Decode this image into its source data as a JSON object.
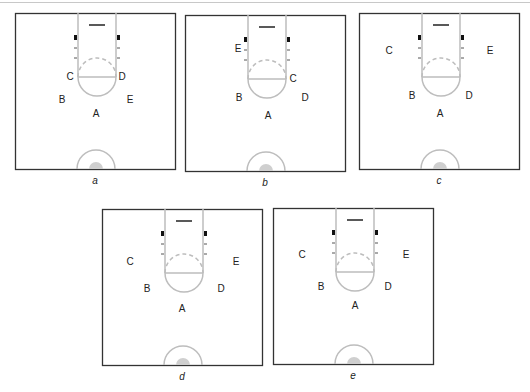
{
  "figure": {
    "colors": {
      "border": "#333333",
      "court_lines": "#bdbdbd",
      "block": "#111111",
      "rim": "#222222",
      "center_fill": "#cfcfcf",
      "text": "#222222"
    },
    "panels": [
      {
        "id": "a",
        "caption": "a",
        "x": 15,
        "y": 13,
        "players": [
          {
            "label": "C",
            "x": 55,
            "y": 64
          },
          {
            "label": "D",
            "x": 107,
            "y": 64
          },
          {
            "label": "B",
            "x": 47,
            "y": 87
          },
          {
            "label": "E",
            "x": 115,
            "y": 87
          },
          {
            "label": "A",
            "x": 81,
            "y": 101
          }
        ]
      },
      {
        "id": "b",
        "caption": "b",
        "x": 185,
        "y": 15,
        "players": [
          {
            "label": "E",
            "x": 53,
            "y": 34
          },
          {
            "label": "C",
            "x": 108,
            "y": 64
          },
          {
            "label": "B",
            "x": 54,
            "y": 83
          },
          {
            "label": "D",
            "x": 120,
            "y": 83
          },
          {
            "label": "A",
            "x": 83,
            "y": 101
          }
        ]
      },
      {
        "id": "c",
        "caption": "c",
        "x": 359,
        "y": 13,
        "players": [
          {
            "label": "C",
            "x": 30,
            "y": 38
          },
          {
            "label": "E",
            "x": 131,
            "y": 38
          },
          {
            "label": "B",
            "x": 53,
            "y": 83
          },
          {
            "label": "D",
            "x": 110,
            "y": 83
          },
          {
            "label": "A",
            "x": 81,
            "y": 101
          }
        ]
      },
      {
        "id": "d",
        "caption": "d",
        "x": 102,
        "y": 209,
        "players": [
          {
            "label": "C",
            "x": 28,
            "y": 53
          },
          {
            "label": "E",
            "x": 134,
            "y": 53
          },
          {
            "label": "B",
            "x": 45,
            "y": 80
          },
          {
            "label": "D",
            "x": 119,
            "y": 80
          },
          {
            "label": "A",
            "x": 80,
            "y": 100
          }
        ]
      },
      {
        "id": "e",
        "caption": "e",
        "x": 273,
        "y": 208,
        "players": [
          {
            "label": "C",
            "x": 29,
            "y": 47
          },
          {
            "label": "E",
            "x": 133,
            "y": 47
          },
          {
            "label": "B",
            "x": 48,
            "y": 79
          },
          {
            "label": "D",
            "x": 115,
            "y": 79
          },
          {
            "label": "A",
            "x": 82,
            "y": 98
          }
        ]
      }
    ]
  }
}
